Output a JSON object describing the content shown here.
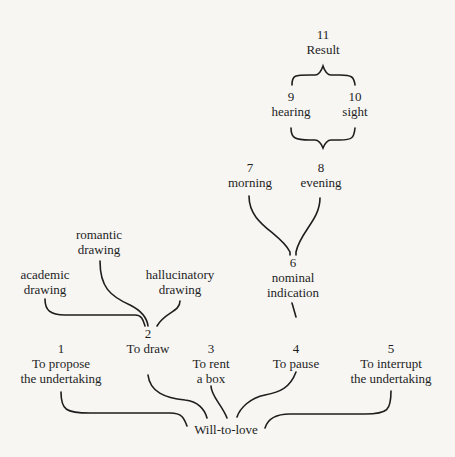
{
  "diagram": {
    "root": {
      "label": "Will-to-love"
    },
    "level1": [
      {
        "num": "1",
        "line1": "To propose",
        "line2": "the undertaking"
      },
      {
        "num": "2",
        "line1": "To draw",
        "line2": ""
      },
      {
        "num": "3",
        "line1": "To rent",
        "line2": "a box"
      },
      {
        "num": "4",
        "line1": "To pause",
        "line2": ""
      },
      {
        "num": "5",
        "line1": "To interrupt",
        "line2": "the undertaking"
      }
    ],
    "drawing_branches": [
      {
        "line1": "academic",
        "line2": "drawing"
      },
      {
        "line1": "romantic",
        "line2": "drawing"
      },
      {
        "line1": "hallucinatory",
        "line2": "drawing"
      }
    ],
    "node6": {
      "num": "6",
      "line1": "nominal",
      "line2": "indication"
    },
    "node7": {
      "num": "7",
      "label": "morning"
    },
    "node8": {
      "num": "8",
      "label": "evening"
    },
    "node9": {
      "num": "9",
      "label": "hearing"
    },
    "node10": {
      "num": "10",
      "label": "sight"
    },
    "node11": {
      "num": "11",
      "label": "Result"
    }
  }
}
